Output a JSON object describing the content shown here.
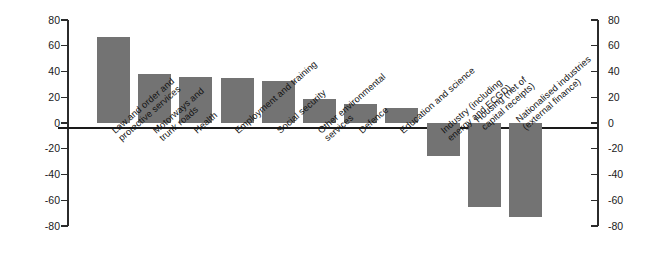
{
  "chart_data": {
    "type": "bar",
    "title": "",
    "subtitle": "",
    "xlabel": "",
    "ylabel": "",
    "ylim": [
      -80,
      80
    ],
    "yticks": [
      80,
      60,
      40,
      20,
      0,
      -20,
      -40,
      -60,
      -80
    ],
    "ytick_labels": [
      "80",
      "60",
      "40",
      "20",
      "0",
      "-20",
      "-40",
      "-60",
      "-80"
    ],
    "grid": false,
    "legend": null,
    "axes": {
      "left_axis": true,
      "right_axis": true,
      "zero_line": true,
      "tick_interval": 20
    },
    "bar_color": "#737373",
    "axis_color": "#2b2b2b",
    "categories": [
      "Law and order and\nprotective services",
      "Motorways and\ntrunk roads",
      "Health",
      "Employment and training",
      "Social security",
      "Other environmental\nservices",
      "Defence",
      "Education and science",
      "Industry (including\nenergy and ECGD)",
      "Housing (net of\ncapital receipts)",
      "Nationalised industries\n(external finance)"
    ],
    "values": [
      67,
      38,
      36,
      35,
      33,
      19,
      15,
      12,
      -26,
      -65,
      -73
    ]
  }
}
